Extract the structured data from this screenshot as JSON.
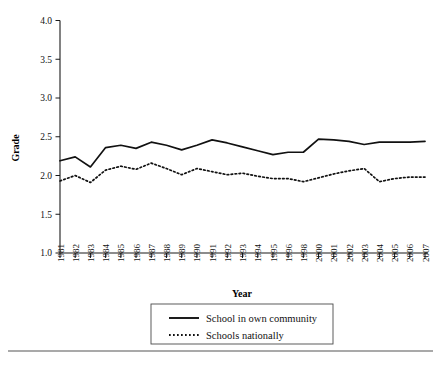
{
  "chart_data": {
    "type": "line",
    "title": "",
    "xlabel": "Year",
    "ylabel": "Grade",
    "ylim": [
      1.0,
      4.0
    ],
    "ytick_labels": [
      "1.0",
      "1.5",
      "2.0",
      "2.5",
      "3.0",
      "3.5",
      "4.0"
    ],
    "ytick_values": [
      1.0,
      1.5,
      2.0,
      2.5,
      3.0,
      3.5,
      4.0
    ],
    "grid": false,
    "legend_position": "bottom-center",
    "categories": [
      "1981",
      "1982",
      "1983",
      "1984",
      "1985",
      "1986",
      "1987",
      "1988",
      "1989",
      "1990",
      "1991",
      "1992",
      "1993",
      "1994",
      "1995",
      "1996",
      "1998",
      "2000",
      "2001",
      "2002",
      "2003",
      "2004",
      "2005",
      "2006",
      "2007"
    ],
    "series": [
      {
        "name": "School in own community",
        "style": "solid",
        "values": [
          2.19,
          2.24,
          2.11,
          2.36,
          2.39,
          2.35,
          2.43,
          2.39,
          2.33,
          2.39,
          2.46,
          2.42,
          2.37,
          2.32,
          2.27,
          2.3,
          2.3,
          2.47,
          2.46,
          2.44,
          2.4,
          2.43,
          2.43,
          2.43,
          2.44
        ]
      },
      {
        "name": "Schools nationally",
        "style": "dotted",
        "values": [
          1.93,
          2.0,
          1.91,
          2.07,
          2.12,
          2.08,
          2.16,
          2.09,
          2.01,
          2.09,
          2.05,
          2.01,
          2.03,
          1.99,
          1.96,
          1.96,
          1.92,
          1.97,
          2.02,
          2.06,
          2.09,
          1.92,
          1.96,
          1.98,
          1.98
        ]
      }
    ]
  },
  "legend": {
    "entries": [
      {
        "label": "School in own community",
        "style": "solid"
      },
      {
        "label": "Schools nationally",
        "style": "dotted"
      }
    ]
  },
  "footer": {
    "caption": ""
  }
}
